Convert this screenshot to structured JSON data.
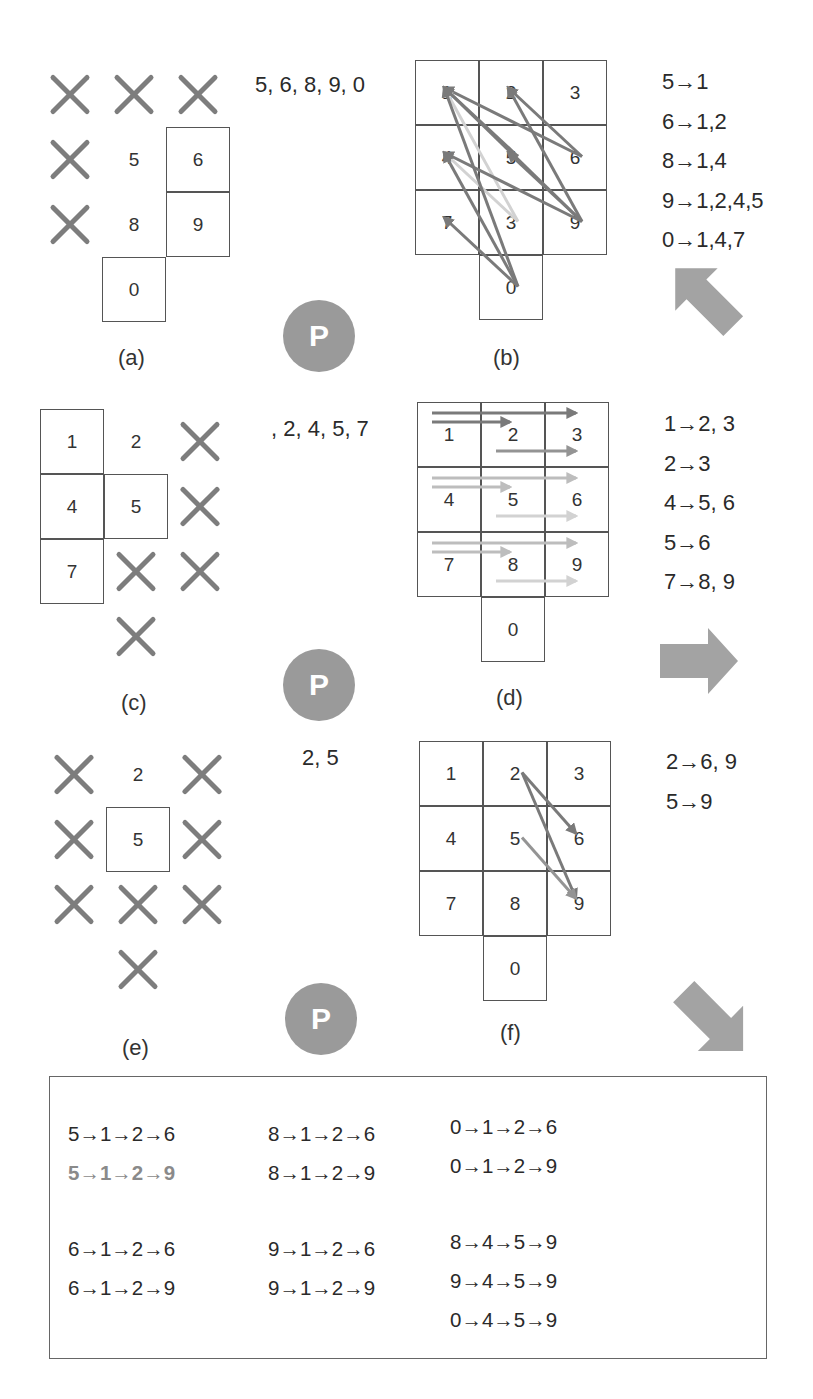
{
  "colors": {
    "arrow_dark": "#7a7a7a",
    "arrow_mid": "#949494",
    "arrow_light": "#bdbdbd",
    "arrow_lighter": "#d2d2d2",
    "cross": "#7d7d7d",
    "badge": "#9a9a9a",
    "big_arrow": "#a3a3a3",
    "highlight_text": "#8a8a8a"
  },
  "panels": {
    "a": {
      "label": "(a)",
      "sequence": "5, 6, 8, 9, 0",
      "grid": [
        [
          "1",
          "2",
          "3"
        ],
        [
          "4",
          "5",
          "6"
        ],
        [
          "7",
          "8",
          "9"
        ],
        [
          "",
          "0",
          ""
        ]
      ],
      "crossed": [
        "1",
        "2",
        "3",
        "4",
        "7"
      ],
      "boxed": [
        "6",
        "9",
        "0"
      ]
    },
    "b": {
      "label": "(b)",
      "grid": [
        [
          "1",
          "2",
          "3"
        ],
        [
          "4",
          "5",
          "6"
        ],
        [
          "7",
          "3",
          "9"
        ],
        [
          "",
          "0",
          ""
        ]
      ],
      "rules": [
        "5→1",
        "6→1,2",
        "8→1,4",
        "9→1,2,4,5",
        "0→1,4,7"
      ],
      "edges": [
        {
          "from": "5",
          "to": "1",
          "tone": "dark"
        },
        {
          "from": "6",
          "to": "1",
          "tone": "dark"
        },
        {
          "from": "6",
          "to": "2",
          "tone": "dark"
        },
        {
          "from": "8",
          "to": "1",
          "tone": "lighter"
        },
        {
          "from": "8",
          "to": "4",
          "tone": "lighter"
        },
        {
          "from": "9",
          "to": "1",
          "tone": "dark"
        },
        {
          "from": "9",
          "to": "2",
          "tone": "dark"
        },
        {
          "from": "9",
          "to": "4",
          "tone": "dark"
        },
        {
          "from": "9",
          "to": "5",
          "tone": "dark"
        },
        {
          "from": "0",
          "to": "1",
          "tone": "dark"
        },
        {
          "from": "0",
          "to": "4",
          "tone": "dark"
        },
        {
          "from": "0",
          "to": "7",
          "tone": "dark"
        }
      ],
      "transition_arrow": "up-left"
    },
    "c": {
      "label": "(c)",
      "sequence": ", 2, 4, 5, 7",
      "grid": [
        [
          "1",
          "2",
          "3"
        ],
        [
          "4",
          "5",
          "6"
        ],
        [
          "7",
          "8",
          "9"
        ],
        [
          "",
          "0",
          ""
        ]
      ],
      "crossed": [
        "3",
        "6",
        "8",
        "9",
        "0"
      ],
      "boxed": [
        "1",
        "4",
        "7",
        "5"
      ]
    },
    "d": {
      "label": "(d)",
      "grid": [
        [
          "1",
          "2",
          "3"
        ],
        [
          "4",
          "5",
          "6"
        ],
        [
          "7",
          "8",
          "9"
        ],
        [
          "",
          "0",
          ""
        ]
      ],
      "rules": [
        "1→2, 3",
        "2→3",
        "4→5, 6",
        "5→6",
        "7→8, 9"
      ],
      "edges": [
        {
          "from": "1",
          "to": "3",
          "tone": "dark"
        },
        {
          "from": "1",
          "to": "2",
          "tone": "dark"
        },
        {
          "from": "2",
          "to": "3",
          "tone": "mid"
        },
        {
          "from": "4",
          "to": "6",
          "tone": "light"
        },
        {
          "from": "4",
          "to": "5",
          "tone": "light"
        },
        {
          "from": "5",
          "to": "6",
          "tone": "lighter"
        },
        {
          "from": "7",
          "to": "9",
          "tone": "light"
        },
        {
          "from": "7",
          "to": "8",
          "tone": "light"
        },
        {
          "from": "8",
          "to": "9",
          "tone": "lighter"
        }
      ],
      "transition_arrow": "right"
    },
    "e": {
      "label": "(e)",
      "sequence": "2, 5",
      "grid": [
        [
          "1",
          "2",
          "3"
        ],
        [
          "4",
          "5",
          "6"
        ],
        [
          "7",
          "8",
          "9"
        ],
        [
          "",
          "0",
          ""
        ]
      ],
      "crossed": [
        "1",
        "3",
        "4",
        "6",
        "7",
        "8",
        "9",
        "0"
      ],
      "boxed": [
        "5"
      ]
    },
    "f": {
      "label": "(f)",
      "grid": [
        [
          "1",
          "2",
          "3"
        ],
        [
          "4",
          "5",
          "6"
        ],
        [
          "7",
          "8",
          "9"
        ],
        [
          "",
          "0",
          ""
        ]
      ],
      "rules": [
        "2→6, 9",
        "5→9"
      ],
      "edges": [
        {
          "from": "2",
          "to": "6",
          "tone": "dark"
        },
        {
          "from": "2",
          "to": "9",
          "tone": "dark"
        },
        {
          "from": "5",
          "to": "9",
          "tone": "mid"
        }
      ],
      "transition_arrow": "down-right"
    }
  },
  "badge_label": "P",
  "summary": {
    "columns": [
      [
        {
          "text": "5→1→2→6",
          "highlight": false
        },
        {
          "text": "5→1→2→9",
          "highlight": true
        },
        {
          "text": "6→1→2→6",
          "highlight": false
        },
        {
          "text": "6→1→2→9",
          "highlight": false
        }
      ],
      [
        {
          "text": "8→1→2→6",
          "highlight": false
        },
        {
          "text": "8→1→2→9",
          "highlight": false
        },
        {
          "text": "9→1→2→6",
          "highlight": false
        },
        {
          "text": "9→1→2→9",
          "highlight": false
        }
      ],
      [
        {
          "text": "0→1→2→6",
          "highlight": false
        },
        {
          "text": "0→1→2→9",
          "highlight": false
        },
        {
          "text": "8→4→5→9",
          "highlight": false
        },
        {
          "text": "9→4→5→9",
          "highlight": false
        },
        {
          "text": "0→4→5→9",
          "highlight": false
        }
      ]
    ]
  }
}
